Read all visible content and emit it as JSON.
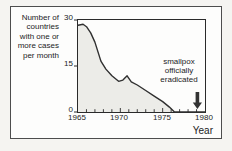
{
  "figure": {
    "page_background": "#f5f4f1",
    "panel_background": "#fdfdfc",
    "frame_border_color": "#4d4d4d"
  },
  "chart_data": {
    "type": "area",
    "ylabel_lines": [
      "Number of",
      "countries",
      "with one or",
      "more cases",
      "per month"
    ],
    "xlabel": "Year",
    "xlim": [
      1965,
      1980
    ],
    "ylim": [
      0,
      30
    ],
    "ytick_values": [
      30,
      15,
      0
    ],
    "ytick_labels": [
      "30",
      "15",
      "0"
    ],
    "xtick_values": [
      1965,
      1970,
      1975,
      1980
    ],
    "xtick_labels": [
      "1965",
      "1970",
      "1975",
      "1980"
    ],
    "xtick_minor_step": 1,
    "grid": false,
    "legend": "none",
    "series": [
      {
        "name": "countries-with-cases",
        "points": [
          [
            1965.0,
            28.3
          ],
          [
            1965.6,
            28.6
          ],
          [
            1966.0,
            27.8
          ],
          [
            1966.5,
            25.8
          ],
          [
            1967.0,
            22.8
          ],
          [
            1967.7,
            16.6
          ],
          [
            1968.3,
            14.0
          ],
          [
            1969.0,
            11.8
          ],
          [
            1969.8,
            10.0
          ],
          [
            1970.3,
            10.4
          ],
          [
            1970.8,
            11.8
          ],
          [
            1971.3,
            9.8
          ],
          [
            1972.0,
            8.8
          ],
          [
            1973.0,
            7.0
          ],
          [
            1974.0,
            5.2
          ],
          [
            1975.0,
            3.4
          ],
          [
            1975.8,
            1.6
          ],
          [
            1976.4,
            0.0
          ],
          [
            1980.0,
            0.0
          ]
        ]
      }
    ],
    "annotation": {
      "lines": [
        "smallpox",
        "officially",
        "eradicated"
      ],
      "arrow_year": 1979.1
    },
    "colors": {
      "line": "#303030",
      "fill": "#ecece8",
      "axis": "#2a2a2a",
      "arrow": "#333333"
    }
  }
}
